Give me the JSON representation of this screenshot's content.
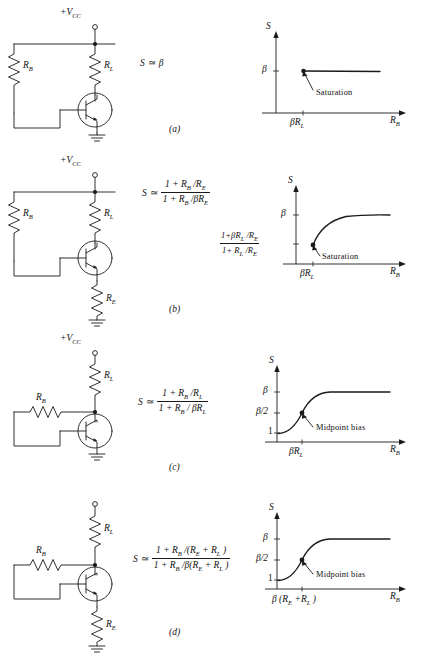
{
  "figure": {
    "type": "transistor-bias-stability-diagram",
    "panel_count": 4
  },
  "symbols": {
    "supply": "+V",
    "supply_sub": "CC",
    "supply_a": "+V",
    "supply_a_sub": "CC",
    "beta": "β",
    "approx": "≃",
    "S": "S"
  },
  "panels": [
    {
      "id": "a",
      "caption": "(a)",
      "circuit": {
        "supply_label": "+V",
        "supply_sub": "CC",
        "resistors": [
          {
            "name": "R",
            "sub": "B",
            "orientation": "vertical"
          },
          {
            "name": "R",
            "sub": "L",
            "orientation": "vertical"
          }
        ],
        "has_emitter_resistor": false,
        "ground": true,
        "device": "npn-transistor"
      },
      "formula": {
        "lhs": "S",
        "rel": "≃",
        "type": "simple",
        "rhs": "β"
      },
      "graph": {
        "ylabel": "S",
        "xlabel": "R",
        "xlabel_sub": "B",
        "yticks": [
          {
            "label": "β",
            "value": "beta"
          }
        ],
        "xticks": [
          {
            "label": "βR",
            "sub": "L"
          }
        ],
        "annotation": "Saturation",
        "shape": "flat-line-at-beta",
        "curve_desc": "Horizontal line at S = β beginning at R_B = βR_L",
        "saturation_dot": true
      }
    },
    {
      "id": "b",
      "caption": "(b)",
      "circuit": {
        "supply_label": "+V",
        "supply_sub": "CC",
        "resistors": [
          {
            "name": "R",
            "sub": "B",
            "orientation": "vertical"
          },
          {
            "name": "R",
            "sub": "L",
            "orientation": "vertical"
          },
          {
            "name": "R",
            "sub": "E",
            "orientation": "vertical"
          }
        ],
        "has_emitter_resistor": true,
        "ground": true,
        "device": "npn-transistor"
      },
      "formula": {
        "lhs": "S",
        "rel": "≃",
        "type": "fraction",
        "numerator": "1 + R_B /R_E",
        "denominator": "1 + R_B /βR_E",
        "num_parts": [
          "1 +",
          "R",
          "B",
          "/",
          "R",
          "E"
        ],
        "den_parts": [
          "1 +",
          "R",
          "B",
          "/",
          "βR",
          "E"
        ]
      },
      "graph": {
        "ylabel": "S",
        "xlabel": "R",
        "xlabel_sub": "B",
        "yticks": [
          {
            "label": "β",
            "value": "beta"
          },
          {
            "label": "(1+βR_L/R_E)/(1+R_L/R_E)",
            "value": "low-asymptote",
            "is_fraction": true,
            "numerator": "1+βR_L /R_E",
            "denominator": "1+ R_L /R_E"
          }
        ],
        "xticks": [
          {
            "label": "βR",
            "sub": "L"
          }
        ],
        "annotation": "Saturation",
        "shape": "rising-curve-saturating-at-beta",
        "curve_desc": "Curve rising from (1+βR_L/R_E)/(1+R_L/R_E) at βR_L, saturating at β",
        "saturation_dot": true
      }
    },
    {
      "id": "c",
      "caption": "(c)",
      "circuit": {
        "supply_label": "+V",
        "supply_sub": "CC",
        "resistors": [
          {
            "name": "R",
            "sub": "B",
            "orientation": "horizontal"
          },
          {
            "name": "R",
            "sub": "L",
            "orientation": "vertical"
          }
        ],
        "has_emitter_resistor": false,
        "ground": true,
        "device": "npn-transistor",
        "feedback": "collector-to-base"
      },
      "formula": {
        "lhs": "S",
        "rel": "≃",
        "type": "fraction",
        "numerator": "1 + R_B /R_L",
        "denominator": "1 + R_B / βR_L"
      },
      "graph": {
        "ylabel": "S",
        "xlabel": "R",
        "xlabel_sub": "B",
        "yticks": [
          {
            "label": "β",
            "value": "beta"
          },
          {
            "label": "β/2",
            "value": "beta-over-2"
          },
          {
            "label": "1",
            "value": "one"
          }
        ],
        "xticks": [
          {
            "label": "βR",
            "sub": "L"
          }
        ],
        "annotation": "Midpoint bias",
        "shape": "s-curve-from-1-to-beta",
        "curve_desc": "S-shaped curve from S = 1 rising through β/2 at βR_L and saturating at β",
        "midpoint_dot": true
      }
    },
    {
      "id": "d",
      "caption": "(d)",
      "circuit": {
        "supply_label": "+V",
        "supply_sub": "CC",
        "resistors": [
          {
            "name": "R",
            "sub": "B",
            "orientation": "horizontal"
          },
          {
            "name": "R",
            "sub": "L",
            "orientation": "vertical"
          },
          {
            "name": "R",
            "sub": "E",
            "orientation": "vertical"
          }
        ],
        "has_emitter_resistor": true,
        "ground": true,
        "device": "npn-transistor",
        "feedback": "collector-to-base"
      },
      "formula": {
        "lhs": "S",
        "rel": "≃",
        "type": "fraction",
        "numerator": "1 + R_B /(R_E + R_L )",
        "denominator": "1 + R_B /β(R_E + R_L )"
      },
      "graph": {
        "ylabel": "S",
        "xlabel": "R",
        "xlabel_sub": "B",
        "yticks": [
          {
            "label": "β",
            "value": "beta"
          },
          {
            "label": "β/2",
            "value": "beta-over-2"
          },
          {
            "label": "1",
            "value": "one"
          }
        ],
        "xticks": [
          {
            "label": "β (R_E +R_L )",
            "is_compound": true
          }
        ],
        "annotation": "Midpoint bias",
        "shape": "s-curve-from-1-to-beta",
        "curve_desc": "S-shaped curve from S = 1 rising through β/2 at β(R_E+R_L) and saturating at β",
        "midpoint_dot": true
      }
    }
  ],
  "colors": {
    "ink": "#1a1a1a",
    "background": "#ffffff"
  }
}
